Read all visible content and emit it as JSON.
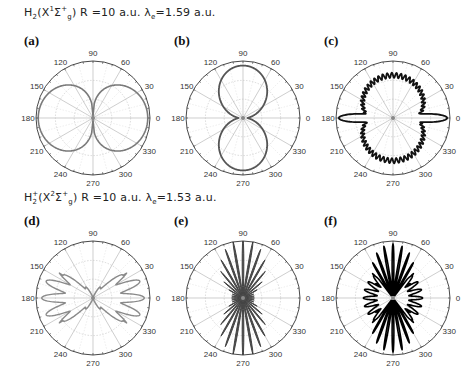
{
  "rows": [
    {
      "title_parts": {
        "mol": "H",
        "mol_sub": "2",
        "mol_sup": "",
        "state": "(X",
        "state_sup_pre": "1",
        "sigma": "Σ",
        "sigma_sup": "+",
        "sigma_sub": "g",
        "rest": ")  R =10 a.u.  λ",
        "lam_sub": "e",
        "lam_val": "=1.59 a.u."
      },
      "title_text": "H2(X1Σg+) R =10 a.u. λe=1.59 a.u."
    },
    {
      "title_parts": {
        "mol": "H",
        "mol_sub": "2",
        "mol_sup": "+",
        "state": "(X",
        "state_sup_pre": "2",
        "sigma": "Σ",
        "sigma_sup": "+",
        "sigma_sub": "g",
        "rest": ")  R =10 a.u.  λ",
        "lam_sub": "e",
        "lam_val": "=1.53 a.u."
      },
      "title_text": "H2+(X2Σg+) R =10 a.u. λe=1.53 a.u."
    }
  ],
  "angle_ticks": [
    "0",
    "30",
    "60",
    "90",
    "120",
    "150",
    "180",
    "210",
    "240",
    "270",
    "300",
    "330"
  ],
  "chart_data": [
    {
      "type": "polar",
      "panel": "(a)",
      "group": "H2 (X1Σg+), R=10 a.u., λe=1.59 a.u.",
      "line_color": "#7a7a7a",
      "fill": false,
      "shape": "two lobes along 0°/180° with shoulders near ±30° and 150°/210°",
      "theta_deg_ticks": [
        0,
        30,
        60,
        90,
        120,
        150,
        180,
        210,
        240,
        270,
        300,
        330
      ],
      "r_max": 1.0,
      "samples_theta_deg": [
        0,
        15,
        30,
        45,
        60,
        75,
        90
      ],
      "samples_r": [
        0.98,
        0.86,
        0.72,
        0.48,
        0.22,
        0.05,
        0.0
      ]
    },
    {
      "type": "polar",
      "panel": "(b)",
      "group": "H2 (X1Σg+), R=10 a.u., λe=1.59 a.u.",
      "line_color": "#555555",
      "fill": false,
      "shape": "two lobes along 90°/270°",
      "theta_deg_ticks": [
        0,
        30,
        60,
        90,
        120,
        150,
        180,
        210,
        240,
        270,
        300,
        330
      ],
      "r_max": 1.0,
      "samples_theta_deg": [
        0,
        15,
        30,
        45,
        60,
        75,
        90
      ],
      "samples_r": [
        0.08,
        0.12,
        0.45,
        0.7,
        0.86,
        0.92,
        0.92
      ]
    },
    {
      "type": "polar",
      "panel": "(c)",
      "group": "H2 (X1Σg+), R=10 a.u., λe=1.59 a.u.",
      "line_color": "#111111",
      "fill": false,
      "shape": "narrow lobes at 0°/180° plus jagged broad lobes at 90°/270°",
      "theta_deg_ticks": [
        0,
        30,
        60,
        90,
        120,
        150,
        180,
        210,
        240,
        270,
        300,
        330
      ],
      "r_max": 1.0,
      "samples_theta_deg": [
        0,
        5,
        10,
        20,
        30,
        45,
        60,
        75,
        90
      ],
      "samples_r": [
        0.95,
        0.4,
        0.1,
        0.25,
        0.5,
        0.65,
        0.72,
        0.75,
        0.74
      ]
    },
    {
      "type": "polar",
      "panel": "(d)",
      "group": "H2+ (X2Σg+), R=10 a.u., λe=1.53 a.u.",
      "line_color": "#8a8a8a",
      "fill": false,
      "shape": "oscillating lobes, maxima near 0°, ±20°, ±40° and 180° side",
      "theta_deg_ticks": [
        0,
        30,
        60,
        90,
        120,
        150,
        180,
        210,
        240,
        270,
        300,
        330
      ],
      "r_max": 1.0
    },
    {
      "type": "polar",
      "panel": "(e)",
      "group": "H2+ (X2Σg+), R=10 a.u., λe=1.53 a.u.",
      "line_color": "#444444",
      "fill": true,
      "shape": "many narrow spikes concentrated around 90°/270°",
      "theta_deg_ticks": [
        0,
        30,
        60,
        90,
        120,
        150,
        180,
        210,
        240,
        270,
        300,
        330
      ],
      "r_max": 1.0
    },
    {
      "type": "polar",
      "panel": "(f)",
      "group": "H2+ (X2Σg+), R=10 a.u., λe=1.53 a.u.",
      "line_color": "#000000",
      "fill": false,
      "shape": "many narrow spikes around 90°/270° with wavy side lobes near 0°/180°",
      "theta_deg_ticks": [
        0,
        30,
        60,
        90,
        120,
        150,
        180,
        210,
        240,
        270,
        300,
        330
      ],
      "r_max": 1.0
    }
  ],
  "panels": [
    {
      "label": "(a)"
    },
    {
      "label": "(b)"
    },
    {
      "label": "(c)"
    },
    {
      "label": "(d)"
    },
    {
      "label": "(e)"
    },
    {
      "label": "(f)"
    }
  ]
}
